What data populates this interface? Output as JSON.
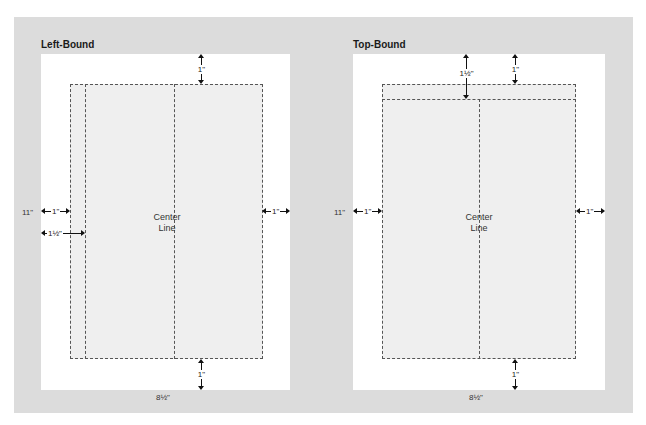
{
  "diagrams": [
    {
      "title": "Left-Bound",
      "page_height_label": "11\"",
      "page_width_label": "8½\"",
      "center_label_line1": "Center",
      "center_label_line2": "Line",
      "margins": {
        "top": "1\"",
        "bottom": "1\"",
        "left": "1\"",
        "left_binding": "1½\"",
        "right": "1\""
      }
    },
    {
      "title": "Top-Bound",
      "page_height_label": "11\"",
      "page_width_label": "8½\"",
      "center_label_line1": "Center",
      "center_label_line2": "Line",
      "margins": {
        "top": "1\"",
        "top_binding": "1½\"",
        "bottom": "1\"",
        "left": "1\"",
        "right": "1\""
      }
    }
  ],
  "colors": {
    "panel": "#dcdcdc",
    "page": "#ffffff",
    "text_area": "#efefef",
    "dash": "#555555"
  }
}
